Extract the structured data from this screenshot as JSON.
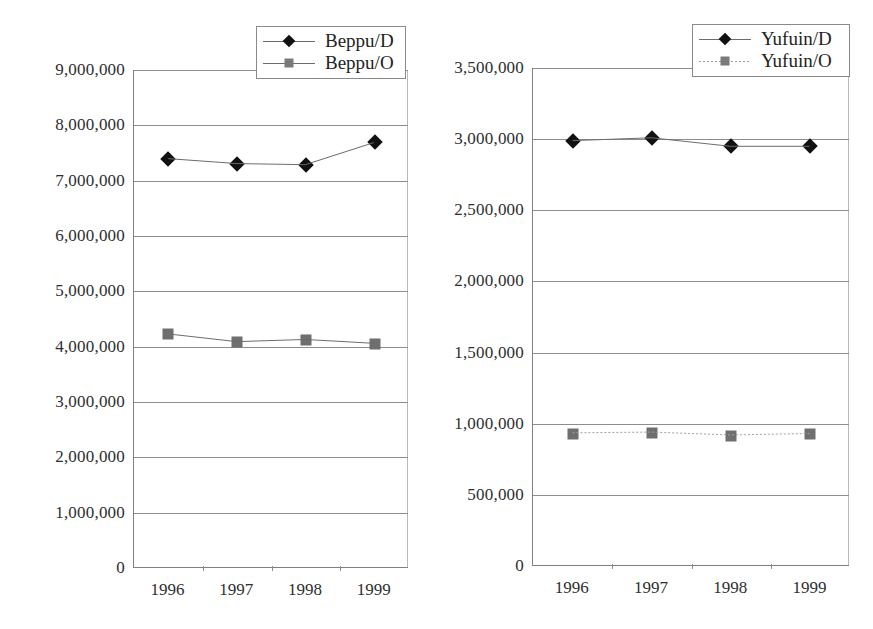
{
  "figure": {
    "background": "#ffffff",
    "panel_count": 2,
    "marker_color_d": "#111111",
    "marker_color_o": "#6f6f6f",
    "gridline_color": "#8d8d8d",
    "axis_color": "#808080"
  },
  "chart_data": [
    {
      "id": "beppu",
      "type": "line",
      "title": "",
      "xlabel": "",
      "ylabel": "",
      "categories": [
        "1996",
        "1997",
        "1998",
        "1999"
      ],
      "x": [
        1996,
        1997,
        1998,
        1999
      ],
      "ylim": [
        0,
        9000000
      ],
      "yticks": [
        0,
        1000000,
        2000000,
        3000000,
        4000000,
        5000000,
        6000000,
        7000000,
        8000000,
        9000000
      ],
      "ytick_labels": [
        "0",
        "1,000,000",
        "2,000,000",
        "3,000,000",
        "4,000,000",
        "5,000,000",
        "6,000,000",
        "7,000,000",
        "8,000,000",
        "9,000,000"
      ],
      "grid": true,
      "legend_position": "top-right",
      "series": [
        {
          "name": "Beppu/D",
          "marker": "diamond",
          "color": "#111111",
          "linestyle": "solid",
          "values": [
            7400000,
            7310000,
            7290000,
            7690000
          ]
        },
        {
          "name": "Beppu/O",
          "marker": "square",
          "color": "#6f6f6f",
          "linestyle": "solid",
          "values": [
            4220000,
            4080000,
            4120000,
            4050000
          ]
        }
      ]
    },
    {
      "id": "yufuin",
      "type": "line",
      "title": "",
      "xlabel": "",
      "ylabel": "",
      "categories": [
        "1996",
        "1997",
        "1998",
        "1999"
      ],
      "x": [
        1996,
        1997,
        1998,
        1999
      ],
      "ylim": [
        0,
        3500000
      ],
      "yticks": [
        0,
        500000,
        1000000,
        1500000,
        2000000,
        2500000,
        3000000,
        3500000
      ],
      "ytick_labels": [
        "0",
        "500,000",
        "1,000,000",
        "1,500,000",
        "2,000,000",
        "2,500,000",
        "3,000,000",
        "3,500,000"
      ],
      "grid": true,
      "legend_position": "top-right",
      "series": [
        {
          "name": "Yufuin/D",
          "marker": "diamond",
          "color": "#111111",
          "linestyle": "solid",
          "values": [
            2990000,
            3010000,
            2950000,
            2950000
          ]
        },
        {
          "name": "Yufuin/O",
          "marker": "square",
          "color": "#6f6f6f",
          "linestyle": "dotted",
          "values": [
            930000,
            935000,
            915000,
            925000
          ]
        }
      ]
    }
  ]
}
